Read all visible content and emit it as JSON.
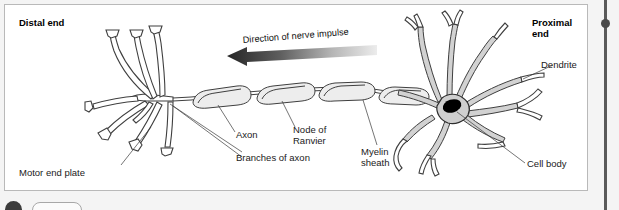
{
  "figure": {
    "title_distal": "Distal end",
    "title_proximal_line1": "Proximal",
    "title_proximal_line2": "end",
    "arrow_label": "Direction of nerve impulse",
    "labels": {
      "axon": "Axon",
      "node_of_ranvier_line1": "Node of",
      "node_of_ranvier_line2": "Ranvier",
      "myelin_line1": "Myelin",
      "myelin_line2": "sheath",
      "branches_of_axon": "Branches of axon",
      "motor_end_plate": "Motor end plate",
      "dendrite": "Dendrite",
      "cell_body": "Cell body"
    }
  },
  "colors": {
    "page_background": "#f4f4f4",
    "card_background": "#ffffff",
    "card_border": "#b9b9b9",
    "ink": "#3f3f3f",
    "soma_fill": "#cfcfcf",
    "nucleus": "#000000",
    "arrow_dark": "#2b2b2b",
    "arrow_light": "#e8e8e8",
    "scrollbar": "#5a5a5a"
  },
  "diagram_content": {
    "type": "labeled-biological-diagram",
    "subject": "motor neuron",
    "orientation": "distal end on the left, proximal end on the right",
    "impulse_direction": "right to left (from cell body toward motor end plates)",
    "parts": [
      "Motor end plate",
      "Branches of axon",
      "Axon",
      "Node of Ranvier",
      "Myelin sheath",
      "Cell body",
      "Dendrite"
    ],
    "myelin_segment_count": 4
  }
}
